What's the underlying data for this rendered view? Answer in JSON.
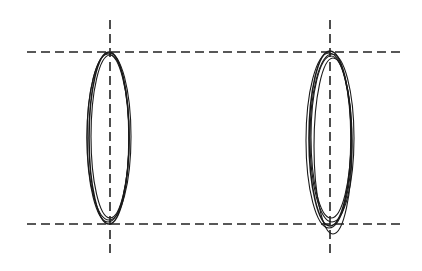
{
  "diagram": {
    "width": 422,
    "height": 271,
    "stroke_color": "#1a1a1a",
    "guide_color": "#222222",
    "guides": {
      "horizontal": [
        {
          "name": "top-guide-line",
          "x1": 27,
          "x2": 405,
          "y": 52
        },
        {
          "name": "bottom-guide-line",
          "x1": 27,
          "x2": 405,
          "y": 224
        }
      ],
      "vertical": [
        {
          "name": "left-axis-line",
          "x": 110,
          "y1": 20,
          "y2": 256
        },
        {
          "name": "right-axis-line",
          "x": 330,
          "y1": 20,
          "y2": 256
        }
      ]
    },
    "loops": [
      {
        "name": "left-ellipse-group",
        "curves": [
          {
            "cx": 109,
            "top": 52,
            "bottom": 224,
            "rx": 20
          },
          {
            "cx": 108,
            "top": 54,
            "bottom": 222,
            "rx": 21
          },
          {
            "cx": 110,
            "top": 55,
            "bottom": 218,
            "rx": 19
          },
          {
            "cx": 109,
            "top": 53,
            "bottom": 220,
            "rx": 22
          }
        ]
      },
      {
        "name": "right-ellipse-group",
        "curves": [
          {
            "cx": 330,
            "top": 51,
            "bottom": 226,
            "rx": 21
          },
          {
            "cx": 332,
            "top": 54,
            "bottom": 222,
            "rx": 22
          },
          {
            "cx": 331,
            "top": 56,
            "bottom": 218,
            "rx": 20
          },
          {
            "cx": 333,
            "top": 58,
            "bottom": 234,
            "rx": 19
          },
          {
            "cx": 329,
            "top": 53,
            "bottom": 228,
            "rx": 23
          }
        ]
      }
    ]
  }
}
